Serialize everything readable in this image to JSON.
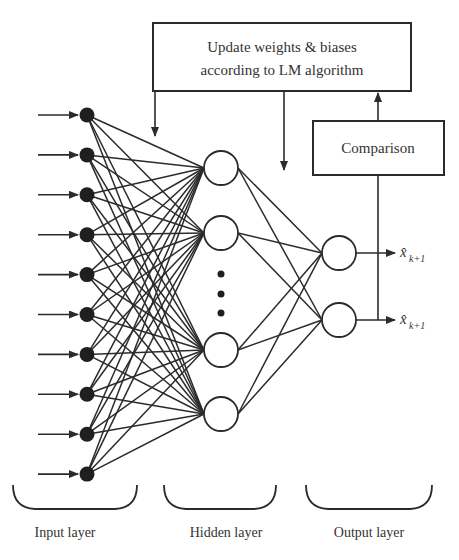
{
  "diagram": {
    "type": "feedforward-neural-network",
    "update_box": {
      "line1": "Update weights & biases",
      "line2": "according to LM algorithm"
    },
    "comparison_box": {
      "label": "Comparison"
    },
    "outputs": [
      {
        "symbol": "x̂",
        "subscript": "k+1"
      },
      {
        "symbol": "x̂",
        "subscript": "k+1"
      }
    ],
    "layers": [
      {
        "label": "Input layer",
        "node_count": 10,
        "node_style": "filled"
      },
      {
        "label": "Hidden layer",
        "node_count": 4,
        "node_style": "hollow",
        "ellipsis": true
      },
      {
        "label": "Output layer",
        "node_count": 2,
        "node_style": "hollow"
      }
    ],
    "colors": {
      "stroke": "#2b2b2b",
      "text": "#333333",
      "background": "#ffffff"
    }
  }
}
